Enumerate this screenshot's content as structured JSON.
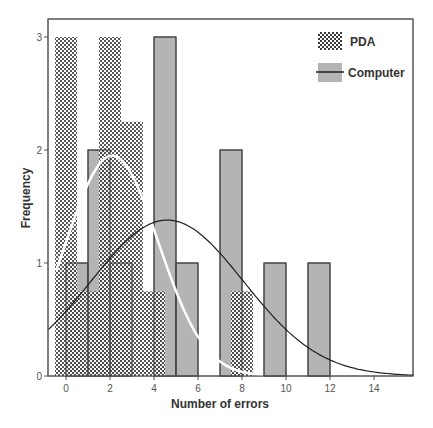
{
  "chart_data": {
    "type": "bar",
    "subtype": "overlaid histogram with normal curves",
    "title": "",
    "xlabel": "Number of errors",
    "ylabel": "Frequency",
    "xlim": [
      -0.8,
      15.8
    ],
    "ylim": [
      0,
      3.35
    ],
    "x_ticks": [
      0,
      2,
      4,
      6,
      8,
      10,
      12,
      14
    ],
    "y_ticks": [
      0,
      1,
      2,
      3
    ],
    "grid": false,
    "legend_position": "top-right",
    "legend": [
      {
        "name": "PDA",
        "swatch": "checkered",
        "curve_color": "#ffffff"
      },
      {
        "name": "Computer",
        "swatch": "gray",
        "curve_color": "#222222"
      }
    ],
    "series": [
      {
        "name": "PDA",
        "fill": "checkered",
        "bins": [
          {
            "center": 0,
            "width": 1,
            "frequency": 3
          },
          {
            "center": 1,
            "width": 1,
            "frequency": 0.75
          },
          {
            "center": 2,
            "width": 1,
            "frequency": 3
          },
          {
            "center": 3,
            "width": 1,
            "frequency": 2.25
          },
          {
            "center": 4,
            "width": 1,
            "frequency": 0.75
          },
          {
            "center": 8,
            "width": 1,
            "frequency": 0.75
          }
        ],
        "normal_curve": {
          "mean": 2.1,
          "sd": 2.1,
          "peak": 1.95,
          "color": "#ffffff"
        }
      },
      {
        "name": "Computer",
        "fill": "#b4b4b4",
        "bins": [
          {
            "start": 0,
            "end": 1,
            "frequency": 1
          },
          {
            "start": 1,
            "end": 2,
            "frequency": 2
          },
          {
            "start": 2,
            "end": 3,
            "frequency": 1
          },
          {
            "start": 4,
            "end": 5,
            "frequency": 3
          },
          {
            "start": 5,
            "end": 6,
            "frequency": 1
          },
          {
            "start": 7,
            "end": 8,
            "frequency": 2
          },
          {
            "start": 9,
            "end": 10,
            "frequency": 1
          },
          {
            "start": 11,
            "end": 12,
            "frequency": 1
          }
        ],
        "normal_curve": {
          "mean": 4.6,
          "sd": 3.47,
          "peak": 1.38,
          "color": "#222222"
        }
      }
    ]
  },
  "colors": {
    "frame": "#555555",
    "computer_fill": "#b4b4b4",
    "computer_outline": "#444444",
    "pda_dark": "#3a3a3a",
    "pda_light": "#ffffff",
    "computer_curve": "#222222",
    "pda_curve": "#ffffff"
  }
}
